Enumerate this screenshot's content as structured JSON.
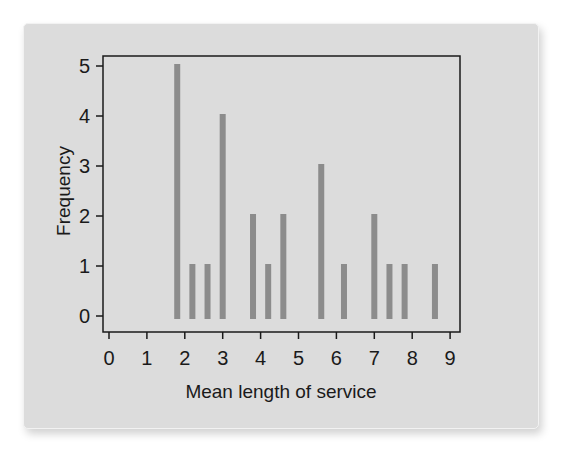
{
  "chart_data": {
    "type": "bar",
    "subtype": "spike/needle histogram",
    "title": "",
    "xlabel": "Mean length of service",
    "ylabel": "Frequency",
    "xlim": [
      0,
      9
    ],
    "ylim": [
      0,
      5
    ],
    "x_ticks": [
      "0",
      "1",
      "2",
      "3",
      "4",
      "5",
      "6",
      "7",
      "8",
      "9"
    ],
    "y_ticks": [
      "0",
      "1",
      "2",
      "3",
      "4",
      "5"
    ],
    "grid": false,
    "legend": null,
    "x": [
      1.8,
      2.2,
      2.6,
      3.0,
      3.8,
      4.2,
      4.6,
      5.6,
      6.2,
      7.0,
      7.4,
      7.8,
      8.6
    ],
    "values": [
      5,
      1,
      1,
      4,
      2,
      1,
      2,
      3,
      1,
      2,
      1,
      1,
      1
    ],
    "colors": {
      "bar": "#8c8c8c",
      "panel_background": "#dcdcdc",
      "axis": "#1a1a1a"
    }
  }
}
